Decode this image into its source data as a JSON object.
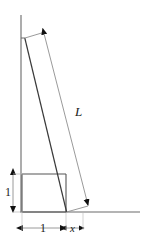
{
  "figure": {
    "type": "geometry-diagram",
    "background_color": "#ffffff",
    "line_color": "#555555",
    "ladder_color": "#3a3a3a",
    "dimension_color": "#777777",
    "arrow_color": "#111111",
    "label_color": "#1a1a1a"
  },
  "labels": {
    "ladder_length": "L",
    "box_height": "1",
    "box_width": "1",
    "ground_gap": "x"
  },
  "geometry": {
    "wall": {
      "x": 21,
      "y_top": 15,
      "y_bottom": 212
    },
    "ground": {
      "y": 212,
      "x_left": 20,
      "x_right": 140
    },
    "box": {
      "x_left": 22,
      "x_right": 66,
      "y_top": 174,
      "y_bottom": 212
    },
    "ladder": {
      "x_top": 25,
      "y_top": 38,
      "x_bottom": 66.5,
      "y_bottom": 212
    },
    "length_dimension": {
      "x_start": 44,
      "y_start": 33,
      "x_end": 88,
      "y_end": 206
    },
    "height_dimension": {
      "x": 13,
      "y_top": 174,
      "y_bottom": 212
    },
    "base_dimension": {
      "y": 228,
      "x_start": 22,
      "x_end": 66
    },
    "gap_dimension": {
      "y": 228,
      "x_start": 66,
      "x_end": 83
    }
  }
}
